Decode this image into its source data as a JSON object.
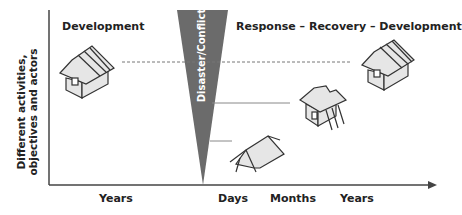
{
  "diagram": {
    "left_title": "Development",
    "right_title": "Response – Recovery – Development",
    "wedge_label": "Disaster/Conflict",
    "y_axis_label_line1": "Different activities,",
    "y_axis_label_line2": "objectives and actors",
    "x_labels": [
      "Years",
      "Days",
      "Months",
      "Years"
    ],
    "colors": {
      "wedge": "#6b6b6b",
      "axis": "#444444",
      "house_fill": "#e6e6e6"
    }
  }
}
